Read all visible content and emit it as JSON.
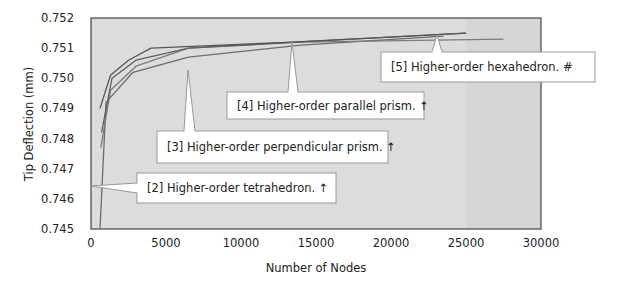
{
  "chart_data": {
    "type": "line",
    "title": "",
    "xlabel": "Number of Nodes",
    "ylabel": "Tip Deflection (mm)",
    "xlim": [
      0,
      30000
    ],
    "ylim": [
      0.745,
      0.752
    ],
    "x_ticks": [
      "0",
      "5000",
      "10000",
      "15000",
      "20000",
      "25000",
      "30000"
    ],
    "y_ticks": [
      "0.745",
      "0.746",
      "0.747",
      "0.748",
      "0.749",
      "0.750",
      "0.751",
      "0.752"
    ],
    "grid": false,
    "legend": "callouts",
    "plot_background": "#dcdcdc",
    "series": [
      {
        "name": "[2] Higher-order tetrahedron. ↑",
        "color": "#6b6b6b",
        "points": [
          [
            600,
            0.745
          ],
          [
            1000,
            0.7492
          ],
          [
            2800,
            0.7502
          ],
          [
            6500,
            0.7507
          ],
          [
            14000,
            0.7511
          ],
          [
            23500,
            0.7514
          ]
        ]
      },
      {
        "name": "[3] Higher-order perpendicular prism. ↑",
        "color": "#7a7a7a",
        "points": [
          [
            650,
            0.7477
          ],
          [
            1300,
            0.7496
          ],
          [
            3000,
            0.7504
          ],
          [
            6500,
            0.751
          ],
          [
            14000,
            0.7512
          ],
          [
            27500,
            0.7513
          ]
        ]
      },
      {
        "name": "[4] Higher-order parallel prism. ↑",
        "color": "#5f5f5f",
        "points": [
          [
            700,
            0.7482
          ],
          [
            1400,
            0.75
          ],
          [
            3000,
            0.7506
          ],
          [
            6500,
            0.751
          ],
          [
            13500,
            0.7512
          ],
          [
            25000,
            0.7515
          ]
        ]
      },
      {
        "name": "[5] Higher-order hexahedron. #",
        "color": "#555555",
        "points": [
          [
            600,
            0.749
          ],
          [
            1300,
            0.7501
          ],
          [
            2500,
            0.7506
          ],
          [
            4000,
            0.751
          ],
          [
            13500,
            0.7512
          ],
          [
            25000,
            0.7515
          ]
        ]
      }
    ],
    "annotations": [
      {
        "label": "[2] Higher-order tetrahedron. ↑",
        "box": [
          137,
          173,
          199,
          30
        ],
        "pointer": [
          [
            137,
            183
          ],
          [
            91,
            186
          ],
          [
            137,
            193
          ]
        ]
      },
      {
        "label": "[3] Higher-order perpendicular prism. ↑",
        "box": [
          157,
          131,
          231,
          32
        ],
        "pointer": [
          [
            184,
            131
          ],
          [
            188,
            70
          ],
          [
            195,
            131
          ]
        ]
      },
      {
        "label": "[4] Higher-order parallel prism. ↑",
        "box": [
          227,
          92,
          197,
          27
        ],
        "pointer": [
          [
            288,
            92
          ],
          [
            292,
            42
          ],
          [
            298,
            92
          ]
        ]
      },
      {
        "label": "[5] Higher-order hexahedron. #",
        "box": [
          381,
          52,
          214,
          30
        ],
        "pointer": [
          [
            432,
            52
          ],
          [
            437,
            35
          ],
          [
            442,
            52
          ]
        ]
      }
    ]
  }
}
